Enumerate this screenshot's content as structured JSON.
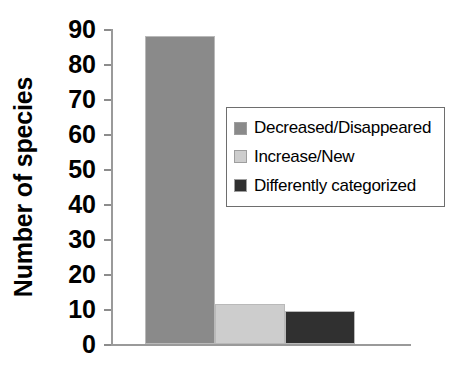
{
  "chart_data": {
    "type": "bar",
    "title": "",
    "xlabel": "",
    "ylabel": "Number of species",
    "categories": [
      "Decreased/Disappeared",
      "Increase/New",
      "Differently categorized"
    ],
    "values": [
      88,
      11.5,
      9.5
    ],
    "ylim": [
      0,
      90
    ],
    "yticks": [
      0,
      10,
      20,
      30,
      40,
      50,
      60,
      70,
      80,
      90
    ],
    "ytick_labels": [
      "0",
      "10",
      "20",
      "30",
      "40",
      "50",
      "60",
      "70",
      "80",
      "90"
    ],
    "xtick_labels": [],
    "grid": false,
    "legend_position": "upper right",
    "series": [
      {
        "name": "Decreased/Disappeared",
        "value": 88,
        "color": "#8a8a8a"
      },
      {
        "name": "Increase/New",
        "value": 11.5,
        "color": "#cdcdcd"
      },
      {
        "name": "Differently categorized",
        "value": 9.5,
        "color": "#303030"
      }
    ]
  },
  "axis": {
    "y_title": "Number of species",
    "axis_line_color": "#9a9a9a",
    "tick_color": "#8c8c8c"
  },
  "legend": {
    "border_color": "#6e6e6e",
    "items": [
      {
        "label": "Decreased/Disappeared",
        "color": "#8a8a8a"
      },
      {
        "label": "Increase/New",
        "color": "#cdcdcd"
      },
      {
        "label": "Differently categorized",
        "color": "#303030"
      }
    ]
  }
}
